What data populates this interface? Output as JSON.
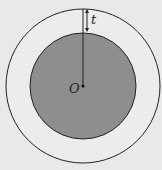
{
  "diagram": {
    "title": "",
    "labels": {
      "center": "O",
      "thickness": "t"
    },
    "colors": {
      "background": "#e9e9e7",
      "outer_ring_fill": "#ececea",
      "inner_disk_fill": "#8e8e8c",
      "stroke": "#222222"
    },
    "elements": {
      "outer_circle": "outer circle",
      "inner_circle": "shaded inner disk",
      "radius_line": "radius from center O to outer edge",
      "thickness_arrow": "double-headed arrow marking ring thickness t"
    }
  }
}
